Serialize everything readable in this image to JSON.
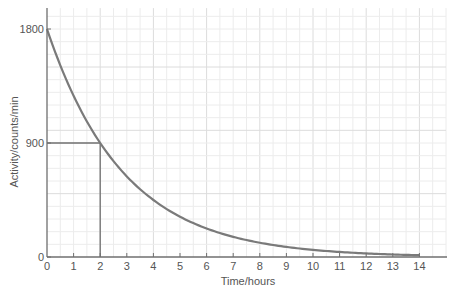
{
  "chart_data": {
    "type": "line",
    "title": "",
    "xlabel": "Time/hours",
    "ylabel": "Activity/counts/min",
    "xlim": [
      0,
      15
    ],
    "ylim": [
      0,
      1965
    ],
    "x_ticks": [
      0,
      1,
      2,
      3,
      4,
      5,
      6,
      7,
      8,
      9,
      10,
      11,
      12,
      13,
      14
    ],
    "y_ticks": [
      0,
      900,
      1800
    ],
    "grid": true,
    "legend": null,
    "series": [
      {
        "name": "Activity",
        "color": "#7a7a7a",
        "x": [
          0,
          0.5,
          1,
          1.5,
          2,
          2.5,
          3,
          3.5,
          4,
          4.5,
          5,
          5.5,
          6,
          6.5,
          7,
          7.5,
          8,
          8.5,
          9,
          9.5,
          10,
          10.5,
          11,
          11.5,
          12,
          12.5,
          13,
          13.5,
          14
        ],
        "values": [
          1800,
          1514,
          1273,
          1070,
          900,
          757,
          636,
          535,
          450,
          378,
          318,
          268,
          225,
          189,
          159,
          134,
          113,
          95,
          80,
          67,
          56,
          47,
          40,
          33,
          28,
          24,
          20,
          17,
          14
        ]
      }
    ],
    "annotations": [
      {
        "type": "half-life-guide",
        "x": 2,
        "y": 900,
        "description": "Horizontal line from y-axis at 900 to curve, vertical line down to t=2"
      }
    ],
    "half_life_hours": 2
  },
  "colors": {
    "curve": "#7a7a7a",
    "axis": "#6f6f6f",
    "grid_minor": "#ececec",
    "grid_major": "#dcdcdc",
    "text": "#555555"
  }
}
